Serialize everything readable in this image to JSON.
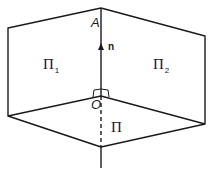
{
  "diagram": {
    "labels": {
      "point_A": "A",
      "point_O": "O",
      "normal_vector": "n",
      "plane_1": "Π",
      "plane_1_sub": "1",
      "plane_2": "Π",
      "plane_2_sub": "2",
      "base_plane": "Π"
    },
    "colors": {
      "stroke": "#1a1a1a",
      "background": "#ffffff"
    }
  }
}
